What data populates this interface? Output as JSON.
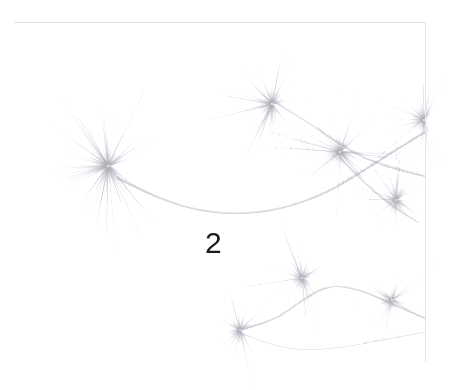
{
  "figure": {
    "number_label": "2",
    "medium": "grayscale-scan",
    "background_color": "#ffffff",
    "ink_color": "#8e8e96",
    "label_color": "#1b1b1b",
    "frame_color": "#e2e2e4",
    "canvas": {
      "width": 450,
      "height": 390
    }
  },
  "plate": {
    "frame": {
      "top_line_y": 22,
      "top_line_x": 14,
      "top_line_width": 412,
      "right_line_x": 425,
      "right_line_y": 22,
      "right_line_height": 340
    },
    "stems": [
      {
        "name": "main-arc-stem",
        "points": [
          [
            118,
            178
          ],
          [
            160,
            200
          ],
          [
            215,
            214
          ],
          [
            270,
            212
          ],
          [
            320,
            196
          ],
          [
            355,
            176
          ],
          [
            392,
            152
          ],
          [
            425,
            132
          ]
        ],
        "width": 3.6,
        "opacity": 0.5
      },
      {
        "name": "upper-right-stem",
        "points": [
          [
            272,
            100
          ],
          [
            305,
            120
          ],
          [
            338,
            143
          ],
          [
            368,
            160
          ],
          [
            400,
            170
          ],
          [
            425,
            176
          ]
        ],
        "width": 3.0,
        "opacity": 0.45
      },
      {
        "name": "lower-branch-stem",
        "points": [
          [
            238,
            330
          ],
          [
            272,
            322
          ],
          [
            302,
            300
          ],
          [
            330,
            284
          ],
          [
            362,
            290
          ],
          [
            395,
            305
          ],
          [
            425,
            318
          ]
        ],
        "width": 3.2,
        "opacity": 0.45
      },
      {
        "name": "lower-tail-stem",
        "points": [
          [
            238,
            332
          ],
          [
            268,
            344
          ],
          [
            300,
            350
          ],
          [
            340,
            348
          ],
          [
            380,
            340
          ],
          [
            425,
            332
          ]
        ],
        "width": 2.6,
        "opacity": 0.38
      },
      {
        "name": "right-cross-stem",
        "points": [
          [
            340,
            158
          ],
          [
            368,
            186
          ],
          [
            392,
            206
          ],
          [
            418,
            222
          ]
        ],
        "width": 2.6,
        "opacity": 0.4
      }
    ],
    "clusters": [
      {
        "name": "cluster-left-large",
        "cx": 108,
        "cy": 166,
        "radius": 78,
        "count": 300,
        "spread_deg": 320,
        "orient_deg": 185,
        "weight": 1.0
      },
      {
        "name": "cluster-top-center",
        "cx": 272,
        "cy": 104,
        "radius": 66,
        "count": 230,
        "spread_deg": 300,
        "orient_deg": 200,
        "weight": 0.9
      },
      {
        "name": "cluster-right-upper",
        "cx": 340,
        "cy": 152,
        "radius": 62,
        "count": 220,
        "spread_deg": 330,
        "orient_deg": 160,
        "weight": 0.95
      },
      {
        "name": "cluster-right-edge",
        "cx": 424,
        "cy": 120,
        "radius": 62,
        "count": 190,
        "spread_deg": 260,
        "orient_deg": 180,
        "weight": 0.85
      },
      {
        "name": "cluster-right-mid",
        "cx": 396,
        "cy": 200,
        "radius": 58,
        "count": 200,
        "spread_deg": 330,
        "orient_deg": 170,
        "weight": 0.9
      },
      {
        "name": "cluster-lower-center",
        "cx": 302,
        "cy": 278,
        "radius": 56,
        "count": 200,
        "spread_deg": 330,
        "orient_deg": 190,
        "weight": 0.85
      },
      {
        "name": "cluster-lower-left",
        "cx": 240,
        "cy": 330,
        "radius": 58,
        "count": 200,
        "spread_deg": 300,
        "orient_deg": 200,
        "weight": 0.8
      },
      {
        "name": "cluster-lower-right",
        "cx": 392,
        "cy": 300,
        "radius": 54,
        "count": 180,
        "spread_deg": 330,
        "orient_deg": 170,
        "weight": 0.8
      }
    ]
  }
}
